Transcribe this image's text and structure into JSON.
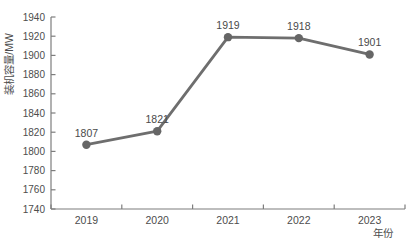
{
  "chart_data": {
    "type": "line",
    "categories": [
      "2019",
      "2020",
      "2021",
      "2022",
      "2023"
    ],
    "values": [
      1807,
      1821,
      1919,
      1918,
      1901
    ],
    "title": "",
    "xlabel": "年份",
    "ylabel": "装机容量/MW",
    "ylim": [
      1740,
      1940
    ],
    "ytick_step": 20,
    "grid": false,
    "legend": "none",
    "line_color": "#6e6e6e",
    "marker_color": "#666666",
    "axis_color": "#7d7d7d",
    "tick_label_color": "#4d4d4d",
    "data_label_color": "#4a4a4a",
    "background": "#ffffff"
  }
}
